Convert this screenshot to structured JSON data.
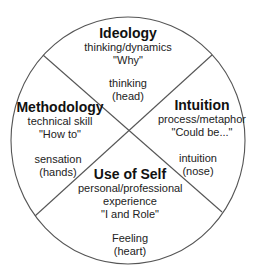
{
  "diagram": {
    "type": "quadrant-circle",
    "line_color": "#555555",
    "quadrants": [
      {
        "id": "ideology",
        "position": "top",
        "title": "Ideology",
        "lines": [
          "thinking/dynamics",
          "\"Why\""
        ],
        "faculty": [
          "thinking",
          "(head)"
        ]
      },
      {
        "id": "methodology",
        "position": "left",
        "title": "Methodology",
        "lines": [
          "technical skill",
          "\"How to\""
        ],
        "faculty": [
          "sensation",
          "(hands)"
        ]
      },
      {
        "id": "intuition",
        "position": "right",
        "title": "Intuition",
        "lines": [
          "process/metaphor",
          "\"Could be...\""
        ],
        "faculty": [
          "intuition",
          "(nose)"
        ]
      },
      {
        "id": "use-of-self",
        "position": "bottom",
        "title": "Use of Self",
        "lines": [
          "personal/professional",
          "experience",
          "\"I and Role\""
        ],
        "faculty": [
          "Feeling",
          "(heart)"
        ]
      }
    ]
  }
}
